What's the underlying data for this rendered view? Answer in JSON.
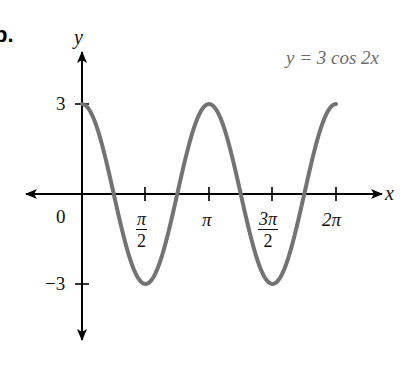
{
  "figure": {
    "part_label": "b.",
    "equation": "y = 3 cos 2x",
    "y_axis_label": "y",
    "x_axis_label": "x",
    "origin_label": "0",
    "y_tick_labels": [
      "3",
      "−3"
    ],
    "x_tick_labels": [
      {
        "num": "π",
        "den": "2",
        "fraction": true
      },
      {
        "text": "π",
        "fraction": false
      },
      {
        "num": "3π",
        "den": "2",
        "fraction": true
      },
      {
        "text": "2π",
        "fraction": false
      }
    ],
    "colors": {
      "curve": "#737373",
      "axes": "#000000",
      "equation": "#6b6b6b"
    }
  },
  "chart_data": {
    "type": "line",
    "title": "y = 3 cos 2x",
    "xlabel": "x",
    "ylabel": "y",
    "function": "y = 3 cos(2x)",
    "x_ticks": [
      "π/2",
      "π",
      "3π/2",
      "2π"
    ],
    "x_tick_values": [
      1.5708,
      3.1416,
      4.7124,
      6.2832
    ],
    "y_ticks": [
      "3",
      "-3"
    ],
    "y_tick_values": [
      3,
      -3
    ],
    "xlim": [
      0,
      6.2832
    ],
    "ylim": [
      -3,
      3
    ],
    "grid": false,
    "legend": "none",
    "series": [
      {
        "name": "y = 3 cos 2x",
        "x": [
          0,
          0.3927,
          0.7854,
          1.1781,
          1.5708,
          1.9635,
          2.3562,
          2.7489,
          3.1416,
          3.5343,
          3.927,
          4.3197,
          4.7124,
          5.1051,
          5.4978,
          5.8905,
          6.2832
        ],
        "values": [
          3,
          2.121,
          0,
          -2.121,
          -3,
          -2.121,
          0,
          2.121,
          3,
          2.121,
          0,
          -2.121,
          -3,
          -2.121,
          0,
          2.121,
          3
        ]
      }
    ],
    "key_points": {
      "maxima": [
        [
          0,
          3
        ],
        [
          3.1416,
          3
        ],
        [
          6.2832,
          3
        ]
      ],
      "minima": [
        [
          1.5708,
          -3
        ],
        [
          4.7124,
          -3
        ]
      ],
      "zeros": [
        0.7854,
        2.3562,
        3.927,
        5.4978
      ]
    }
  }
}
